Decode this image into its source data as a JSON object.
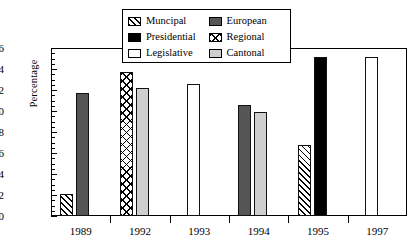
{
  "chart_data": {
    "type": "bar",
    "title": "",
    "xlabel": "",
    "ylabel": "Percentage",
    "categories": [
      "1989",
      "1992",
      "1993",
      "1994",
      "1995",
      "1997"
    ],
    "ylim": [
      0,
      16
    ],
    "ytick_labels": [
      "0",
      "2",
      "4",
      "6",
      "8",
      "10",
      "12",
      "14",
      "16"
    ],
    "ytick_values": [
      0,
      2,
      4,
      6,
      8,
      10,
      12,
      14,
      16
    ],
    "minor_tick_step": 0.5,
    "grid": false,
    "legend_position": "top-center",
    "series": [
      {
        "name": "Muncipal",
        "fill": "hatch",
        "color": "#ffffff",
        "values": [
          2.1,
          null,
          null,
          null,
          6.8,
          null
        ]
      },
      {
        "name": "Presidential",
        "fill": "solid",
        "color": "#000000",
        "values": [
          null,
          null,
          null,
          null,
          15.1,
          null
        ]
      },
      {
        "name": "Legislative",
        "fill": "solid",
        "color": "#ffffff",
        "values": [
          null,
          null,
          12.6,
          null,
          null,
          15.1
        ]
      },
      {
        "name": "European",
        "fill": "solid",
        "color": "#555555",
        "values": [
          11.7,
          null,
          null,
          10.6,
          null,
          null
        ]
      },
      {
        "name": "Regional",
        "fill": "cross-hatch",
        "color": "#ffffff",
        "values": [
          null,
          13.7,
          null,
          null,
          null,
          null
        ]
      },
      {
        "name": "Cantonal",
        "fill": "solid",
        "color": "#cfcfcf",
        "values": [
          null,
          12.2,
          null,
          9.9,
          null,
          null
        ]
      }
    ],
    "bars": [
      {
        "category": "1989",
        "series": "Muncipal",
        "value": 2.1,
        "fill": "hatch"
      },
      {
        "category": "1989",
        "series": "European",
        "value": 11.7,
        "fill": "darkgray"
      },
      {
        "category": "1992",
        "series": "Regional",
        "value": 13.7,
        "fill": "cross"
      },
      {
        "category": "1992",
        "series": "Cantonal",
        "value": 12.2,
        "fill": "lightgray"
      },
      {
        "category": "1993",
        "series": "Legislative",
        "value": 12.6,
        "fill": "white"
      },
      {
        "category": "1994",
        "series": "European",
        "value": 10.6,
        "fill": "darkgray"
      },
      {
        "category": "1994",
        "series": "Cantonal",
        "value": 9.9,
        "fill": "lightgray"
      },
      {
        "category": "1995",
        "series": "Muncipal",
        "value": 6.8,
        "fill": "hatch"
      },
      {
        "category": "1995",
        "series": "Presidential",
        "value": 15.1,
        "fill": "black"
      },
      {
        "category": "1997",
        "series": "Legislative",
        "value": 15.1,
        "fill": "white"
      }
    ]
  },
  "legend": {
    "items": [
      {
        "label": "Muncipal",
        "fill": "hatch"
      },
      {
        "label": "European",
        "fill": "darkgray"
      },
      {
        "label": "Presidential",
        "fill": "black"
      },
      {
        "label": "Regional",
        "fill": "cross"
      },
      {
        "label": "Legislative",
        "fill": "white"
      },
      {
        "label": "Cantonal",
        "fill": "lightgray"
      }
    ]
  },
  "colors": {
    "axis": "#000000",
    "black": "#000000",
    "dark_gray": "#555555",
    "light_gray": "#cfcfcf",
    "white": "#ffffff",
    "background": "#ffffff"
  }
}
